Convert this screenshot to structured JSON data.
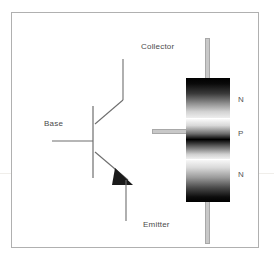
{
  "figure": {
    "background_color": "#ffffff",
    "frame_color": "#b0b0b0"
  },
  "schematic": {
    "name": "npn-transistor-symbol",
    "terminals": [
      {
        "id": "collector",
        "label": "Collector",
        "position": "top"
      },
      {
        "id": "base",
        "label": "Base",
        "position": "left"
      },
      {
        "id": "emitter",
        "label": "Emitter",
        "position": "bottom"
      }
    ],
    "arrow_on": "emitter",
    "arrow_direction": "outward",
    "stroke_color": "#6e6e6e",
    "arrow_color": "#1a1a1a"
  },
  "structure": {
    "name": "npn-layer-stack",
    "layers": [
      {
        "id": "layer-n-collector",
        "label": "N",
        "region": "top"
      },
      {
        "id": "layer-p-base",
        "label": "P",
        "region": "middle"
      },
      {
        "id": "layer-n-emitter",
        "label": "N",
        "region": "bottom"
      }
    ],
    "lead_color": "#c8c8c8",
    "lead_border_color": "#a8a8a8"
  },
  "labels": {
    "collector": "Collector",
    "base": "Base",
    "emitter": "Emitter",
    "layer_n_top": "N",
    "layer_p_mid": "P",
    "layer_n_bot": "N"
  }
}
